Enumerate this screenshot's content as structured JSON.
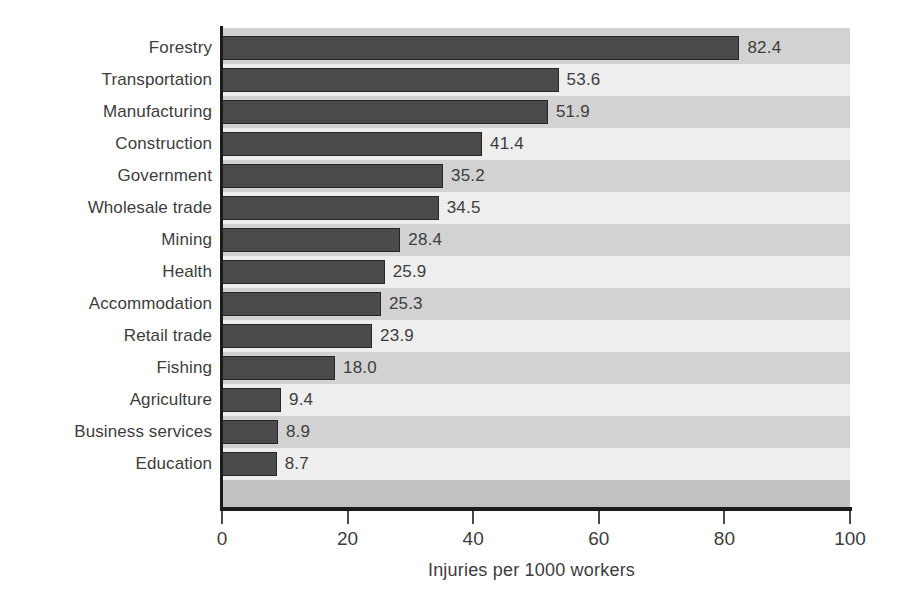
{
  "chart_data": {
    "type": "bar",
    "orientation": "horizontal",
    "title": "",
    "xlabel": "Injuries per 1000 workers",
    "ylabel": "",
    "xlim": [
      0,
      100
    ],
    "xticks": [
      0,
      20,
      40,
      60,
      80,
      100
    ],
    "xtick_labels": [
      "0",
      "20",
      "40",
      "60",
      "80",
      "100"
    ],
    "grid": false,
    "legend": false,
    "value_label_format": "one-decimal",
    "categories": [
      "Forestry",
      "Transportation",
      "Manufacturing",
      "Construction",
      "Government",
      "Wholesale trade",
      "Mining",
      "Health",
      "Accommodation",
      "Retail trade",
      "Fishing",
      "Agriculture",
      "Business services",
      "Education"
    ],
    "values": [
      82.4,
      53.6,
      51.9,
      41.4,
      35.2,
      34.5,
      28.4,
      25.9,
      25.3,
      23.9,
      18.0,
      9.4,
      8.9,
      8.7
    ],
    "value_labels": [
      "82.4",
      "53.6",
      "51.9",
      "41.4",
      "35.2",
      "34.5",
      "28.4",
      "25.9",
      "25.3",
      "23.9",
      "18.0",
      "9.4",
      "8.9",
      "8.7"
    ],
    "colors": {
      "bar_fill": "#4b4b4b",
      "bar_stroke": "#262626",
      "band_light": "#eeeeee",
      "band_dark": "#d2d2d2",
      "band_tail": "#c2c2c2",
      "axis": "#1b1b1b",
      "text": "#3d3d3d",
      "background": "#ffffff"
    }
  }
}
